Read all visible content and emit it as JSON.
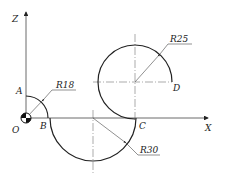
{
  "diagram": {
    "axes": {
      "x_label": "X",
      "z_label": "Z"
    },
    "points": {
      "origin": "O",
      "A": "A",
      "B": "B",
      "C": "C",
      "D": "D"
    },
    "dimensions": {
      "r_small": "R18",
      "r_lower": "R30",
      "r_upper": "R25"
    },
    "colors": {
      "line": "#222222",
      "centerline": "#555555",
      "background": "#ffffff"
    }
  }
}
